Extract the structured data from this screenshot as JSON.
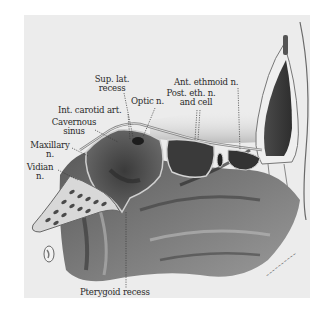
{
  "figure": {
    "kind": "anatomical illustration",
    "background_color": "#ececec",
    "labels": [
      {
        "id": "sup-lat-recess",
        "lines": [
          "Sup. lat.",
          "recess"
        ]
      },
      {
        "id": "optic-n",
        "lines": [
          "Optic n."
        ]
      },
      {
        "id": "ant-ethmoid-n",
        "lines": [
          "Ant. ethmoid n."
        ]
      },
      {
        "id": "post-eth-n",
        "lines": [
          "Post. eth. n.",
          "and cell"
        ]
      },
      {
        "id": "int-carotid-art",
        "lines": [
          "Int. carotid art."
        ]
      },
      {
        "id": "cavernous-sinus",
        "lines": [
          "Cavernous",
          "sinus"
        ]
      },
      {
        "id": "maxillary-n",
        "lines": [
          "Maxillary",
          "n."
        ]
      },
      {
        "id": "vidian-n",
        "lines": [
          "Vidian",
          "n."
        ]
      },
      {
        "id": "pterygoid-recess",
        "lines": [
          "Pterygoid recess"
        ]
      }
    ],
    "signature": "artist signature"
  }
}
